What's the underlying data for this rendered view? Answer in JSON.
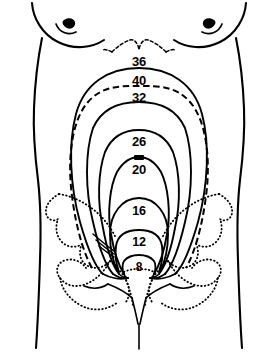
{
  "figure": {
    "type": "medical-illustration",
    "view": "anterior-abdomen",
    "background_color": "#ffffff",
    "line_color": "#000000"
  },
  "labels": {
    "w36": "36",
    "w40": "40",
    "w32": "32",
    "w26": "26",
    "w20": "20",
    "w16": "16",
    "w12": "12",
    "w8": "8",
    "mark_above_20": ""
  },
  "curves": [
    {
      "week": "36",
      "style": "solid",
      "apex_y": 70,
      "note": "highest fundal height, at xiphoid"
    },
    {
      "week": "40",
      "style": "dashed",
      "apex_y": 88,
      "note": "after lightening, fundus drops"
    },
    {
      "week": "32",
      "style": "solid",
      "apex_y": 104
    },
    {
      "week": "26",
      "style": "solid",
      "apex_y": 132
    },
    {
      "week": "20",
      "style": "solid",
      "apex_y": 159,
      "note": "at umbilicus"
    },
    {
      "week": "16",
      "style": "solid",
      "apex_y": 200
    },
    {
      "week": "12",
      "style": "solid",
      "apex_y": 232,
      "note": "just above symphysis pubis"
    },
    {
      "week": "8",
      "style": "solid",
      "apex_y": 258,
      "note": "within pelvis"
    }
  ],
  "anatomy": {
    "body_outline": "solid",
    "breasts": "solid",
    "nipples": "solid-filled",
    "ribcage_costal_margin": "dashed",
    "pelvis": "dotted",
    "sacrum_coccyx": "dotted",
    "perineum": "solid"
  }
}
